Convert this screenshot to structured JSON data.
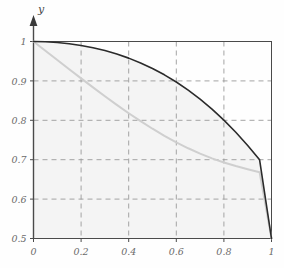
{
  "figure": {
    "background_color": "#fefefe",
    "frame_color": "#4a4a4a",
    "grid_color": "#9a9a9a",
    "fill_color": "#f4f4f4",
    "axis_label_color": "#6b6b6b"
  },
  "chart_data": {
    "type": "line",
    "title": "",
    "xlabel": "",
    "ylabel": "y",
    "xlim": [
      0,
      1
    ],
    "ylim": [
      0.5,
      1
    ],
    "grid": true,
    "legend": "none",
    "x_ticks": [
      0,
      0.2,
      0.4,
      0.6,
      0.8,
      1
    ],
    "x_tick_labels": [
      "0",
      "0.2",
      "0.4",
      "0.6",
      "0.8",
      "1"
    ],
    "y_ticks": [
      0.5,
      0.6,
      0.7,
      0.8,
      0.9,
      1
    ],
    "y_tick_labels": [
      "0.5",
      "0.6",
      "0.7",
      "0.8",
      "0.9",
      "1"
    ],
    "series": [
      {
        "name": "dark-curve",
        "color": "#2b2b2b",
        "width": 1.6,
        "x": [
          0,
          0.05,
          0.1,
          0.15,
          0.2,
          0.25,
          0.3,
          0.35,
          0.4,
          0.45,
          0.5,
          0.55,
          0.6,
          0.65,
          0.7,
          0.75,
          0.8,
          0.85,
          0.9,
          0.95,
          1
        ],
        "y": [
          1.0,
          0.9994,
          0.9975,
          0.9944,
          0.99,
          0.9842,
          0.977,
          0.9682,
          0.9578,
          0.9456,
          0.9315,
          0.9154,
          0.8972,
          0.8767,
          0.8538,
          0.8284,
          0.8004,
          0.7697,
          0.7362,
          0.6997,
          0.5
        ]
      },
      {
        "name": "light-curve",
        "color": "#cfcfcf",
        "width": 2.0,
        "x": [
          0,
          0.05,
          0.1,
          0.15,
          0.2,
          0.25,
          0.3,
          0.35,
          0.4,
          0.45,
          0.5,
          0.55,
          0.6,
          0.65,
          0.7,
          0.75,
          0.8,
          0.85,
          0.9,
          0.95,
          1
        ],
        "y": [
          1.0,
          0.9765,
          0.953,
          0.9296,
          0.9064,
          0.8835,
          0.861,
          0.8391,
          0.818,
          0.7978,
          0.7786,
          0.7607,
          0.7441,
          0.729,
          0.7154,
          0.7034,
          0.6929,
          0.6838,
          0.6758,
          0.6682,
          0.5
        ]
      }
    ]
  }
}
